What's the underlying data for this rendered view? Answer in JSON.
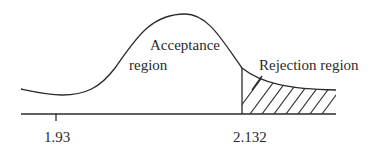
{
  "diagram": {
    "type": "distribution-rejection-region",
    "labels": {
      "acceptance_line1": "Acceptance",
      "acceptance_line2": "region",
      "rejection": "Rejection region"
    },
    "axis_ticks": [
      {
        "label": "1.93",
        "value": 1.93,
        "tick_mark": true
      },
      {
        "label": "2.132",
        "value": 2.132,
        "tick_mark": false
      }
    ],
    "critical_value": 2.132,
    "observed_value": 1.93,
    "shaded_region": "right-tail",
    "colors": {
      "ink": "#2a2a2a",
      "background": "#ffffff"
    }
  }
}
